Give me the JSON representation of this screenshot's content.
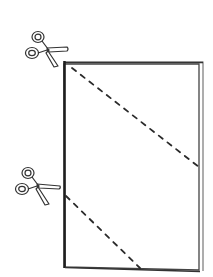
{
  "diagram": {
    "colors": {
      "background": "#ffffff",
      "line": "#333333",
      "spine": "#1e1e1e",
      "dash": "#2a2a2a",
      "paper": "#ffffff"
    },
    "paper": {
      "top_left": [
        64,
        62
      ],
      "top_right": [
        202,
        62
      ],
      "bottom_left": [
        65,
        267
      ],
      "bottom_right": [
        200,
        272
      ]
    },
    "cut_lines": [
      {
        "from": [
          72,
          68
        ],
        "to": [
          199,
          167
        ]
      },
      {
        "from": [
          66,
          196
        ],
        "to": [
          140,
          268
        ]
      }
    ],
    "scissors": [
      {
        "position": [
          44,
          48
        ],
        "points_to": "top-left corner"
      },
      {
        "position": [
          36,
          188
        ],
        "points_to": "left edge"
      }
    ]
  }
}
